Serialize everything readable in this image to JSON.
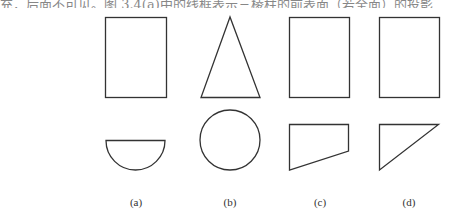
{
  "page": {
    "top_text_fragment": "充，后面不可见。图 3.4(a)中的线框表示三棱柱的前表面（若全面）的投影",
    "bottom_text_fragment": "……"
  },
  "figure": {
    "stroke_color": "#333333",
    "panels": [
      {
        "label": "(a)",
        "top_view": "rectangle",
        "bottom_view": "semicircle",
        "caption_x": 136
      },
      {
        "label": "(b)",
        "top_view": "triangle",
        "bottom_view": "circle",
        "caption_x": 230
      },
      {
        "label": "(c)",
        "top_view": "rectangle",
        "bottom_view": "right-trapezoid",
        "caption_x": 320
      },
      {
        "label": "(d)",
        "top_view": "rectangle",
        "bottom_view": "right-triangle",
        "caption_x": 409
      }
    ]
  }
}
